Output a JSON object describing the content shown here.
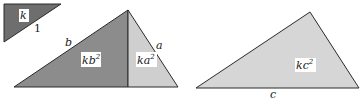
{
  "diagram": {
    "small_triangle": {
      "area_label": "k",
      "side_label": "1",
      "fill": "#6e6e6e"
    },
    "big_triangle": {
      "left_part": {
        "area_label": "kb",
        "exp": "2",
        "fill": "#8c8c8c",
        "side_label": "b"
      },
      "right_part": {
        "area_label": "ka",
        "exp": "2",
        "fill": "#cfcfcf",
        "side_label": "a"
      }
    },
    "right_triangle": {
      "area_label": "kc",
      "exp": "2",
      "side_label": "c",
      "fill": "#d6d6d6"
    },
    "colors": {
      "stroke": "#2a2a2a"
    }
  }
}
